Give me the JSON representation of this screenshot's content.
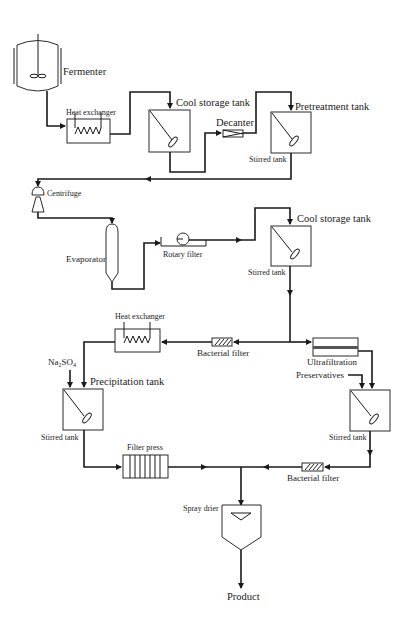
{
  "diagram": {
    "units": {
      "fermenter": "Fermenter",
      "heat_exchanger_1": "Heat exchanger",
      "cool_storage_tank_1": "Cool storage tank",
      "decanter": "Decanter",
      "pretreatment_tank": "Pretreatment tank",
      "stirred_tank_1": "Stirred tank",
      "centrifuge": "Centrifuge",
      "evaporator": "Evaporator",
      "rotary_filter": "Rotary filter",
      "cool_storage_tank_2": "Cool storage tank",
      "stirred_tank_2": "Stirred tank",
      "heat_exchanger_2": "Heat exchanger",
      "bacterial_filter_1": "Bacterial filter",
      "ultrafiltration": "Ultrafiltration",
      "preservatives": "Preservatives",
      "na2so4_main": "Na",
      "na2so4_sub1": "2",
      "na2so4_mid": "SO",
      "na2so4_sub2": "4",
      "precipitation_tank": "Precipitation tank",
      "stirred_tank_3": "Stirred tank",
      "stirred_tank_4": "Stirred tank",
      "filter_press": "Filter press",
      "bacterial_filter_2": "Bacterial filter",
      "spray_drier": "Spray drier",
      "product": "Product"
    },
    "colors": {
      "line": "#1a1a1a",
      "background": "#ffffff"
    }
  }
}
